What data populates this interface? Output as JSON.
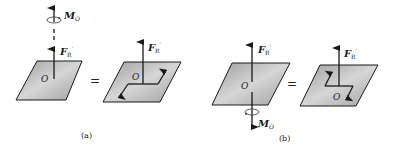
{
  "figure": {
    "panels": [
      {
        "id": "a",
        "caption": "(a)",
        "moment_label": "M",
        "moment_sub": "O",
        "force_label": "F",
        "force_sub": "R",
        "force_prime": "′",
        "origin_label": "O",
        "equals": "=",
        "right_force_label": "F",
        "right_force_sub": "R",
        "right_origin_label": "O"
      },
      {
        "id": "b",
        "caption": "(b)",
        "moment_label": "M",
        "moment_sub": "O",
        "force_label": "F",
        "force_sub": "R",
        "force_prime": "′",
        "origin_label": "O",
        "equals": "=",
        "right_force_label": "F",
        "right_force_sub": "R",
        "right_origin_label": "O"
      }
    ],
    "colors": {
      "plate_fill": "#a9a9a9",
      "plate_highlight": "#d8d8d8",
      "stroke": "#1a1a1a"
    }
  }
}
